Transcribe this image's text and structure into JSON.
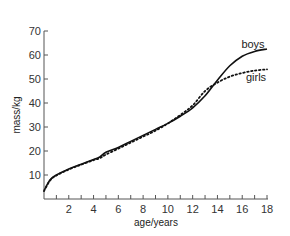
{
  "chart_data": {
    "type": "line",
    "title": "",
    "xlabel": "age/years",
    "ylabel": "mass/kg",
    "xlim": [
      0,
      18
    ],
    "ylim": [
      0,
      70
    ],
    "x_ticks": [
      2,
      4,
      6,
      8,
      10,
      12,
      14,
      16,
      18
    ],
    "y_ticks": [
      10,
      20,
      30,
      40,
      50,
      60,
      70
    ],
    "grid": false,
    "legend": "inline labels at line ends",
    "series": [
      {
        "name": "boys",
        "style": "solid",
        "x": [
          0,
          0.5,
          1,
          2,
          3,
          4,
          4.5,
          5,
          6,
          7,
          8,
          9,
          10,
          11,
          12,
          13,
          14,
          15,
          16,
          17,
          18
        ],
        "values": [
          3.5,
          8,
          10,
          12.5,
          14.5,
          16.5,
          17.5,
          19.5,
          21.5,
          24,
          26.5,
          29,
          31.5,
          34.5,
          38,
          43,
          49.5,
          55.5,
          59.5,
          61.5,
          62.5
        ]
      },
      {
        "name": "girls",
        "style": "dotted",
        "x": [
          0,
          0.5,
          1,
          2,
          3,
          4,
          4.5,
          5,
          6,
          7,
          8,
          9,
          10,
          11,
          12,
          13,
          14,
          15,
          16,
          17,
          18
        ],
        "values": [
          3.3,
          7.8,
          9.8,
          12.3,
          14.3,
          16.2,
          17,
          18.5,
          21,
          23.5,
          26,
          28.5,
          31.5,
          35,
          39,
          45,
          48.5,
          51,
          52.5,
          53.5,
          54
        ]
      }
    ]
  },
  "labels": {
    "ylabel": "mass/kg",
    "xlabel": "age/years",
    "boys": "boys",
    "girls": "girls",
    "y_ticks": [
      "10",
      "20",
      "30",
      "40",
      "50",
      "60",
      "70"
    ],
    "x_ticks": [
      "2",
      "4",
      "6",
      "8",
      "10",
      "12",
      "14",
      "16",
      "18"
    ]
  }
}
